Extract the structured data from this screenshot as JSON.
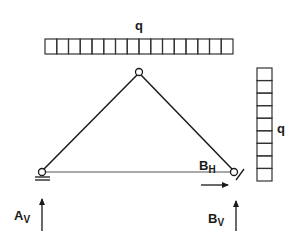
{
  "diagram": {
    "colors": {
      "stroke": "#1a1a1a",
      "background": "#ffffff"
    },
    "loads": {
      "top": {
        "label": "q",
        "cells": 16,
        "orientation": "horizontal"
      },
      "side": {
        "label": "q",
        "cells": 9,
        "orientation": "vertical"
      }
    },
    "hinges": [
      {
        "name": "A",
        "type": "roller-support"
      },
      {
        "name": "apex",
        "type": "hinge"
      },
      {
        "name": "B",
        "type": "pinned-support"
      }
    ],
    "reactions": {
      "A_vertical": {
        "main": "A",
        "sub": "V"
      },
      "B_vertical": {
        "main": "B",
        "sub": "V"
      },
      "B_horizontal": {
        "main": "B",
        "sub": "H"
      }
    }
  }
}
